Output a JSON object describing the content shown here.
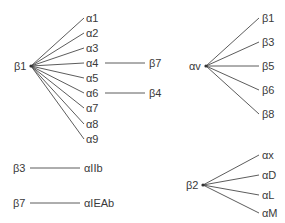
{
  "diagram": {
    "type": "integrin-subunit-pairings",
    "groups": {
      "beta1": {
        "hub": "β1",
        "partners": [
          "α1",
          "α2",
          "α3",
          "α4",
          "α5",
          "α6",
          "α7",
          "α8",
          "α9"
        ],
        "cross_links": [
          {
            "from": "α4",
            "to": "β7"
          },
          {
            "from": "α6",
            "to": "β4"
          }
        ]
      },
      "alphav": {
        "hub": "αv",
        "partners": [
          "β1",
          "β3",
          "β5",
          "β6",
          "β8"
        ]
      },
      "beta3": {
        "hub": "β3",
        "partners": [
          "αIIb"
        ]
      },
      "beta7": {
        "hub": "β7",
        "partners": [
          "αIEAb"
        ]
      },
      "beta2": {
        "hub": "β2",
        "partners": [
          "αx",
          "αD",
          "αL",
          "αM"
        ]
      }
    },
    "colors": {
      "line": "#4a4a4a",
      "text": "#3a3a3a",
      "background": "#ffffff"
    }
  }
}
